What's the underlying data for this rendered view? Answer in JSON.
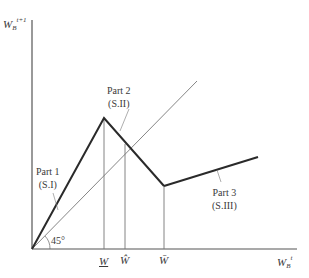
{
  "diagram": {
    "type": "piecewise-linear map with 45-degree line",
    "y_axis_label": {
      "base": "W",
      "sub": "B",
      "sup": "t+1"
    },
    "x_axis_label": {
      "base": "W",
      "sub": "B",
      "sup": "t"
    },
    "angle_label": "45°",
    "x_ticks": [
      {
        "id": "w-underbar",
        "label": "W",
        "mark": "underline"
      },
      {
        "id": "w-hat",
        "label": "Ŵ",
        "mark": "hat"
      },
      {
        "id": "w-bar",
        "label": "W̄",
        "mark": "bar"
      }
    ],
    "segments": [
      {
        "name": "Part 1",
        "code": "(S.I)",
        "from": [
          0,
          0
        ],
        "to": [
          "W_",
          "peak"
        ]
      },
      {
        "name": "Part 2",
        "code": "(S.II)",
        "from": [
          "W_",
          "peak"
        ],
        "to": [
          "W̄",
          "trough"
        ]
      },
      {
        "name": "Part 3",
        "code": "(S.III)",
        "from": [
          "W̄",
          "trough"
        ],
        "to": [
          "end",
          "rising"
        ]
      }
    ],
    "colors": {
      "axis": "#555555",
      "curve": "#2a2a2a",
      "guide": "#777777",
      "text": "#3a3a3a"
    }
  }
}
